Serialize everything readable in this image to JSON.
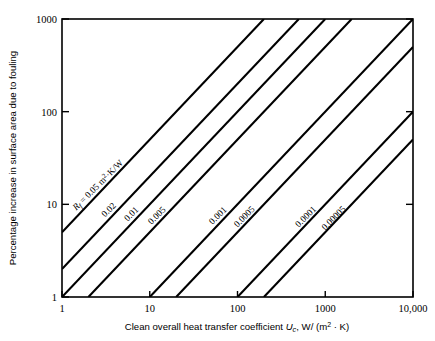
{
  "chart_data": {
    "type": "line",
    "title": "",
    "xlabel": "Clean overall heat transfer coefficient U_c, W/ (m² · K)",
    "ylabel": "Percentage increase in surface area due to fouling",
    "xscale": "log",
    "yscale": "log",
    "xlim": [
      1,
      10000
    ],
    "ylim": [
      1,
      1000
    ],
    "grid": false,
    "legend": "inline-curve-labels",
    "xticklabels": [
      "1",
      "10",
      "100",
      "1000",
      "10,000"
    ],
    "xtickvalues": [
      1,
      10,
      100,
      1000,
      10000
    ],
    "yticklabels": [
      "1",
      "10",
      "100",
      "1000"
    ],
    "ytickvalues": [
      1,
      10,
      100,
      1000
    ],
    "relation": "percentage increase = 100 * Rf * Uc",
    "series": [
      {
        "name": "Rf = 0.05 m2 K/W",
        "label": "R",
        "label_sub": "f",
        "label_rest": " = 0.05 m",
        "label_sup": "2",
        "label_tail": "·K/W",
        "rf": 0.05,
        "x": [
          1,
          200
        ],
        "y": [
          5,
          1000
        ],
        "label_x": 1.45,
        "label_y": 8.5
      },
      {
        "name": "0.02",
        "label": "0.02",
        "rf": 0.02,
        "x": [
          1,
          500
        ],
        "y": [
          2,
          1000
        ],
        "label_x": 3.1,
        "label_y": 7.2
      },
      {
        "name": "0.01",
        "label": "0.01",
        "rf": 0.01,
        "x": [
          1,
          1000
        ],
        "y": [
          1,
          1000
        ],
        "label_x": 5.6,
        "label_y": 6.5
      },
      {
        "name": "0.005",
        "label": "0.005",
        "rf": 0.005,
        "x": [
          2,
          2000
        ],
        "y": [
          1,
          1000
        ],
        "label_x": 10.5,
        "label_y": 6.0
      },
      {
        "name": "0.001",
        "label": "0.001",
        "rf": 0.001,
        "x": [
          10,
          10000
        ],
        "y": [
          1,
          1000
        ],
        "label_x": 52,
        "label_y": 6.0
      },
      {
        "name": "0.0005",
        "label": "0.0005",
        "rf": 0.0005,
        "x": [
          20,
          10000
        ],
        "y": [
          1,
          500
        ],
        "label_x": 100,
        "label_y": 5.6
      },
      {
        "name": "0.0001",
        "label": "0.0001",
        "rf": 0.0001,
        "x": [
          100,
          10000
        ],
        "y": [
          1,
          100
        ],
        "label_x": 500,
        "label_y": 5.6
      },
      {
        "name": "0.00005",
        "label": "0.00005",
        "rf": 5e-05,
        "x": [
          200,
          10000
        ],
        "y": [
          1,
          50
        ],
        "label_x": 1000,
        "label_y": 5.2
      }
    ]
  },
  "axes": {
    "x_title_parts": {
      "lead": "Clean overall heat transfer coefficient ",
      "symbol": "U",
      "symbol_sub": "c",
      "tail": ", W/ (m",
      "sup": "2",
      "end": " · K)"
    },
    "y_title": "Percentage increase in surface area due to fouling"
  },
  "colors": {
    "line": "#000000",
    "frame": "#000000",
    "background": "#ffffff",
    "text": "#000000"
  }
}
